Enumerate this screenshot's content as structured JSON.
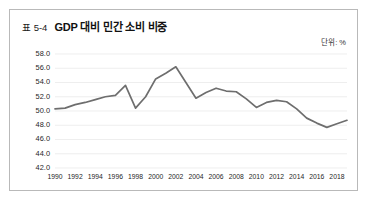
{
  "figure": {
    "table_number": "표 5-4",
    "title": "GDP 대비 민간 소비 비중",
    "unit_label": "단위: %",
    "border_color": "#b9b9b9",
    "line_color": "#6e6e6e",
    "grid_color": "#e6e6e6"
  },
  "chart_data": {
    "type": "line",
    "title": "GDP 대비 민간 소비 비중",
    "xlabel": "",
    "ylabel": "",
    "unit": "%",
    "ylim": [
      42.0,
      58.0
    ],
    "ytick_step": 2.0,
    "ytick_labels": [
      "58.0",
      "56.0",
      "54.0",
      "52.0",
      "50.0",
      "48.0",
      "46.0",
      "44.0",
      "42.0"
    ],
    "ytick_values": [
      58.0,
      56.0,
      54.0,
      52.0,
      50.0,
      48.0,
      46.0,
      44.0,
      42.0
    ],
    "xtick_labels": [
      "1990",
      "1992",
      "1994",
      "1996",
      "1998",
      "2000",
      "2002",
      "2004",
      "2006",
      "2008",
      "2010",
      "2012",
      "2014",
      "2016",
      "2018"
    ],
    "xtick_values": [
      1990,
      1992,
      1994,
      1996,
      1998,
      2000,
      2002,
      2004,
      2006,
      2008,
      2010,
      2012,
      2014,
      2016,
      2018
    ],
    "xlim": [
      1990,
      2019
    ],
    "grid": true,
    "legend": false,
    "x": [
      1990,
      1991,
      1992,
      1993,
      1994,
      1995,
      1996,
      1997,
      1998,
      1999,
      2000,
      2001,
      2002,
      2003,
      2004,
      2005,
      2006,
      2007,
      2008,
      2009,
      2010,
      2011,
      2012,
      2013,
      2014,
      2015,
      2016,
      2017,
      2018,
      2019
    ],
    "values": [
      50.3,
      50.4,
      50.9,
      51.2,
      51.6,
      52.0,
      52.2,
      53.6,
      50.4,
      52.0,
      54.5,
      55.3,
      56.2,
      54.0,
      51.8,
      52.6,
      53.2,
      52.8,
      52.7,
      51.7,
      50.5,
      51.2,
      51.5,
      51.3,
      50.3,
      49.0,
      48.3,
      47.7,
      48.2,
      48.7
    ]
  }
}
